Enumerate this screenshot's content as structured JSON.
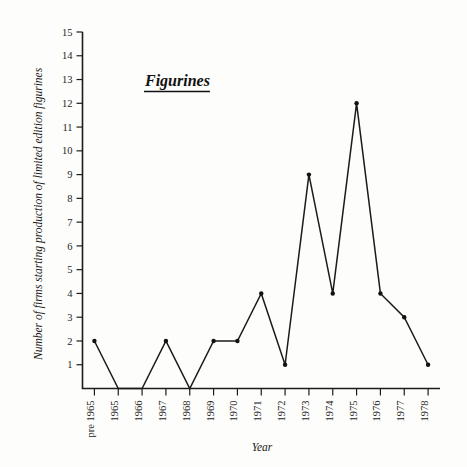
{
  "chart_data": {
    "type": "line",
    "title": "Figurines",
    "xlabel": "Year",
    "ylabel": "Number of firms starting production of limited edition figurines",
    "categories": [
      "pre 1965",
      "1965",
      "1966",
      "1967",
      "1968",
      "1969",
      "1970",
      "1971",
      "1972",
      "1973",
      "1974",
      "1975",
      "1976",
      "1977",
      "1978"
    ],
    "values": [
      2,
      0,
      0,
      2,
      0,
      2,
      2,
      4,
      1,
      9,
      4,
      12,
      4,
      3,
      1
    ],
    "ylim": [
      0,
      15
    ],
    "ytick_labels": [
      "1",
      "2",
      "3",
      "4",
      "5",
      "6",
      "7",
      "8",
      "9",
      "10",
      "11",
      "12",
      "13",
      "14",
      "15"
    ],
    "ytick_values": [
      1,
      2,
      3,
      4,
      5,
      6,
      7,
      8,
      9,
      10,
      11,
      12,
      13,
      14,
      15
    ],
    "grid": false,
    "legend": false,
    "marker": "filled-circle",
    "line_color": "#1b1b1b",
    "marker_color": "#121212",
    "axis_color": "#1c1c1c",
    "background": "#fdfdfb"
  }
}
